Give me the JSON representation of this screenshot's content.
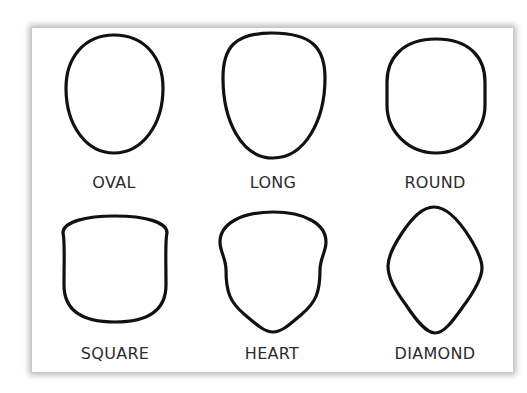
{
  "figure": {
    "shapes": [
      {
        "id": "oval",
        "label": "OVAL"
      },
      {
        "id": "long",
        "label": "LONG"
      },
      {
        "id": "round",
        "label": "ROUND"
      },
      {
        "id": "square",
        "label": "SQUARE"
      },
      {
        "id": "heart",
        "label": "HEART"
      },
      {
        "id": "diamond",
        "label": "DIAMOND"
      }
    ],
    "stroke_color": "#111111",
    "label_color": "#2b2b2b",
    "background": "#ffffff"
  }
}
